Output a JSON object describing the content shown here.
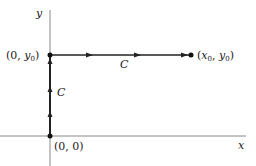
{
  "diagram": {
    "axes": {
      "x_label": "x",
      "y_label": "y"
    },
    "points": {
      "origin": "(0, 0)",
      "top_left": "(0, y₀)",
      "end": "(x₀, y₀)"
    },
    "path_labels": {
      "vertical": "C",
      "horizontal": "C"
    },
    "colors": {
      "line": "#222222",
      "axis": "#777777"
    }
  }
}
